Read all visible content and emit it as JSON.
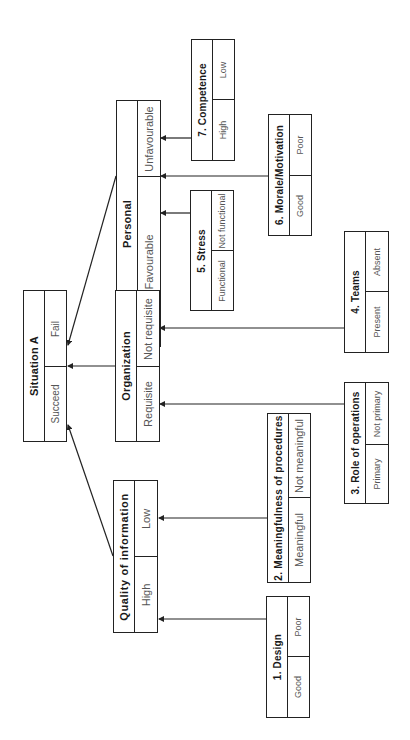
{
  "diagram": {
    "orientation": "rotated 90 degrees counter-clockwise",
    "root": {
      "title": "Situation A",
      "values": [
        "Fail",
        "Succeed"
      ]
    },
    "level1": [
      {
        "id": "personal",
        "title": "Personal",
        "values": [
          "Unfavourable",
          "Favourable"
        ]
      },
      {
        "id": "organization",
        "title": "Organization",
        "values": [
          "Not requisite",
          "Requisite"
        ]
      },
      {
        "id": "quality",
        "title": "Quality of information",
        "values": [
          "Low",
          "High"
        ]
      }
    ],
    "factors": [
      {
        "id": "competence",
        "title": "7.  Competence",
        "values": [
          "Low",
          "High"
        ],
        "parent": "personal"
      },
      {
        "id": "morale",
        "title": "6.  Morale/Motivation",
        "values": [
          "Poor",
          "Good"
        ],
        "parent": "personal"
      },
      {
        "id": "stress",
        "title": "5.  Stress",
        "values": [
          "Not functional",
          "Functional"
        ],
        "parent": "personal"
      },
      {
        "id": "teams",
        "title": "4.  Teams",
        "values": [
          "Absent",
          "Present"
        ],
        "parent": "organization"
      },
      {
        "id": "role",
        "title": "3.  Role of operations",
        "values": [
          "Not primary",
          "Primary"
        ],
        "parent": "organization"
      },
      {
        "id": "meaningfulness",
        "title": "2.  Meaningfulness of procedures",
        "values": [
          "Not meaningful",
          "Meaningful"
        ],
        "parent": "quality"
      },
      {
        "id": "design",
        "title": "1.  Design",
        "values": [
          "Poor",
          "Good"
        ],
        "parent": "quality"
      }
    ]
  }
}
